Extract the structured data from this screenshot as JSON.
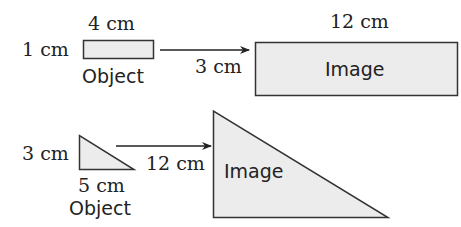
{
  "colors": {
    "shape_fill": "#ececec",
    "stroke": "#333333",
    "text": "#222222",
    "background": "#ffffff"
  },
  "diagram1": {
    "object": {
      "shape": "rectangle",
      "width_label": "4 cm",
      "height_label": "1 cm",
      "caption": "Object"
    },
    "arrow_label": "3 cm",
    "image": {
      "shape": "rectangle",
      "width_label": "12 cm",
      "caption": "Image"
    }
  },
  "diagram2": {
    "object": {
      "shape": "right-triangle",
      "height_label": "3 cm",
      "base_label": "5 cm",
      "caption": "Object"
    },
    "arrow_label": "12 cm",
    "image": {
      "shape": "right-triangle",
      "caption": "Image"
    }
  }
}
